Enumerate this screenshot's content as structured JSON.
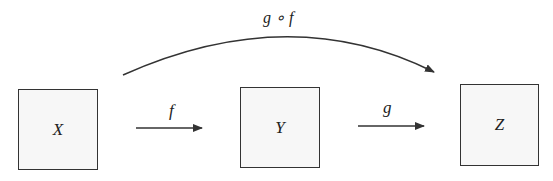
{
  "diagram": {
    "nodes": [
      {
        "id": "X",
        "label": "X"
      },
      {
        "id": "Y",
        "label": "Y"
      },
      {
        "id": "Z",
        "label": "Z"
      }
    ],
    "edges": [
      {
        "from": "X",
        "to": "Y",
        "label": "f"
      },
      {
        "from": "Y",
        "to": "Z",
        "label": "g"
      },
      {
        "from": "X",
        "to": "Z",
        "label": "g ∘ f",
        "style": "curved"
      }
    ],
    "colors": {
      "stroke": "#333333",
      "box_fill": "#f7f7f7",
      "text": "#222222"
    }
  }
}
